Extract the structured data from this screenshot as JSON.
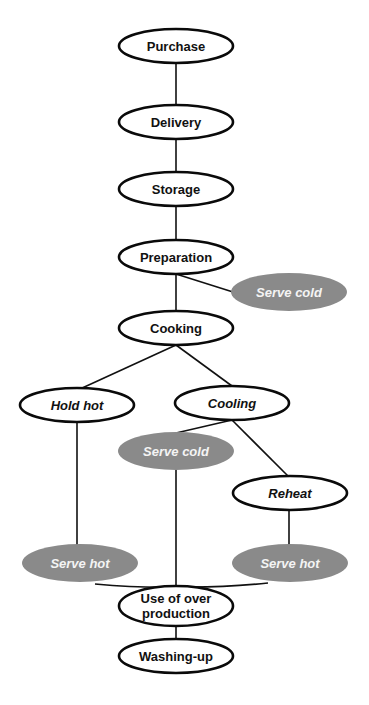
{
  "diagram": {
    "colors": {
      "outline": "#0a0a0a",
      "serve_fill": "#8a8a8a",
      "serve_text": "#f4f4f4",
      "background": "#ffffff"
    },
    "nodes": {
      "purchase": {
        "label": "Purchase"
      },
      "delivery": {
        "label": "Delivery"
      },
      "storage": {
        "label": "Storage"
      },
      "preparation": {
        "label": "Preparation"
      },
      "serve_cold_1": {
        "label": "Serve cold"
      },
      "cooking": {
        "label": "Cooking"
      },
      "hold_hot": {
        "label": "Hold hot"
      },
      "cooling": {
        "label": "Cooling"
      },
      "serve_cold_2": {
        "label": "Serve cold"
      },
      "reheat": {
        "label": "Reheat"
      },
      "serve_hot_1": {
        "label": "Serve hot"
      },
      "serve_hot_2": {
        "label": "Serve hot"
      },
      "use_over_production": {
        "label_line1": "Use of over",
        "label_line2": "production"
      },
      "washing_up": {
        "label": "Washing-up"
      }
    },
    "edges": [
      [
        "purchase",
        "delivery"
      ],
      [
        "delivery",
        "storage"
      ],
      [
        "storage",
        "preparation"
      ],
      [
        "preparation",
        "serve_cold_1"
      ],
      [
        "preparation",
        "cooking"
      ],
      [
        "cooking",
        "hold_hot"
      ],
      [
        "cooking",
        "cooling"
      ],
      [
        "cooling",
        "serve_cold_2"
      ],
      [
        "cooling",
        "reheat"
      ],
      [
        "hold_hot",
        "serve_hot_1"
      ],
      [
        "reheat",
        "serve_hot_2"
      ],
      [
        "serve_cold_2",
        "use_over_production"
      ],
      [
        "serve_hot_1",
        "use_over_production"
      ],
      [
        "serve_hot_2",
        "use_over_production"
      ],
      [
        "use_over_production",
        "washing_up"
      ]
    ]
  }
}
